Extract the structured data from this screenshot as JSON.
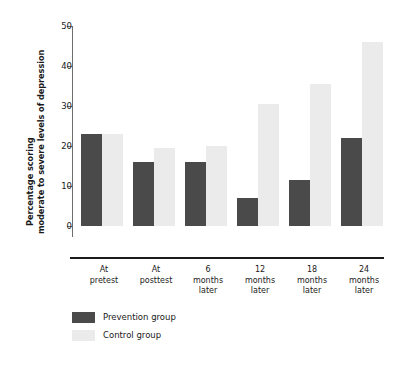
{
  "chart_data": {
    "type": "bar",
    "title": "",
    "xlabel": "",
    "ylabel": "Percentage scoring moderate to severe levels of depression",
    "ylabel_line1": "Percentage scoring",
    "ylabel_line2": "moderate to severe levels of depression",
    "ylim": [
      0,
      50
    ],
    "yticks": [
      0,
      10,
      20,
      30,
      40,
      50
    ],
    "ytick_labels": [
      "0",
      "10",
      "20",
      "30",
      "40",
      "50"
    ],
    "grid": false,
    "legend_position": "bottom-left",
    "categories": [
      "At pretest",
      "At posttest",
      "6 months later",
      "12 months later",
      "18 months later",
      "24 months later"
    ],
    "category_lines": [
      [
        "At",
        "pretest"
      ],
      [
        "At",
        "posttest"
      ],
      [
        "6",
        "months",
        "later"
      ],
      [
        "12",
        "months",
        "later"
      ],
      [
        "18",
        "months",
        "later"
      ],
      [
        "24",
        "months",
        "later"
      ]
    ],
    "series": [
      {
        "name": "Prevention group",
        "color": "#4a4a4a",
        "values": [
          23,
          16,
          16,
          7,
          11.5,
          22
        ]
      },
      {
        "name": "Control group",
        "color": "#ebebeb",
        "values": [
          23,
          19.5,
          20,
          30.5,
          35.5,
          46
        ]
      }
    ]
  },
  "legend": {
    "items": [
      {
        "label": "Prevention group",
        "color": "#4a4a4a"
      },
      {
        "label": "Control group",
        "color": "#ebebeb"
      }
    ]
  }
}
